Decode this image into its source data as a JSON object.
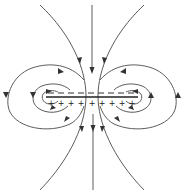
{
  "figure": {
    "type": "field-line-diagram",
    "plate": {
      "top_charge_sign": "−",
      "bottom_charge_sign": "+",
      "top_charge_count": 9,
      "bottom_charge_count": 9
    },
    "field_direction": "downward",
    "colors": {
      "line": "#4a4a4a",
      "background": "#ffffff"
    },
    "plus_signs": [
      "+",
      "+",
      "+",
      "+",
      "+",
      "+",
      "+",
      "+",
      "+"
    ],
    "minus_signs": [
      "−",
      "−",
      "−",
      "−",
      "−",
      "−",
      "−",
      "−",
      "−"
    ]
  }
}
